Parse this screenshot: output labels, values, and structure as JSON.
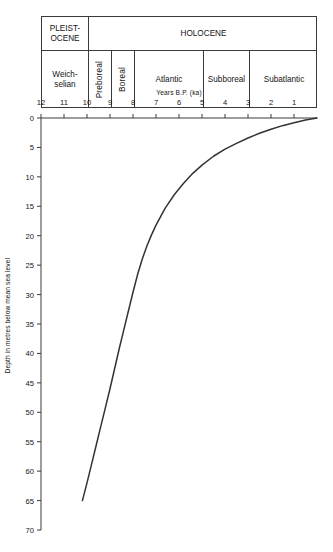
{
  "chart_data": {
    "type": "line",
    "title": "",
    "xlabel": "Years B.P. (ka)",
    "ylabel": "Depth in metres below mean sea level",
    "xlim": [
      12,
      0
    ],
    "ylim": [
      70,
      0
    ],
    "x_inverted": true,
    "y_inverted": true,
    "grid": false,
    "legend": "none",
    "xticks": [
      12,
      11,
      10,
      9,
      8,
      7,
      6,
      5,
      4,
      3,
      2,
      1
    ],
    "xtick_labels": [
      "12",
      "11",
      "10",
      "9",
      "8",
      "7",
      "6",
      "5",
      "4",
      "3",
      "2",
      "1"
    ],
    "yticks": [
      0,
      5,
      10,
      15,
      20,
      25,
      30,
      35,
      40,
      45,
      50,
      55,
      60,
      65,
      70
    ],
    "ytick_labels": [
      "0",
      "5",
      "10",
      "15",
      "20",
      "25",
      "30",
      "35",
      "40",
      "45",
      "50",
      "55",
      "60",
      "65",
      "70"
    ],
    "series": [
      {
        "name": "Relative sea-level curve",
        "color": "#333333",
        "x": [
          10.2,
          10.0,
          9.8,
          9.6,
          9.4,
          9.2,
          9.0,
          8.8,
          8.6,
          8.4,
          8.2,
          8.0,
          7.8,
          7.6,
          7.4,
          7.2,
          7.0,
          6.6,
          6.2,
          5.8,
          5.4,
          5.0,
          4.5,
          4.0,
          3.5,
          3.0,
          2.5,
          2.0,
          1.5,
          1.0,
          0.5,
          0.0
        ],
        "y": [
          65.0,
          62.0,
          58.8,
          55.6,
          52.4,
          49.2,
          46.0,
          42.6,
          39.2,
          36.0,
          32.8,
          29.6,
          26.6,
          24.0,
          21.8,
          19.9,
          18.2,
          15.3,
          13.0,
          11.1,
          9.4,
          8.0,
          6.5,
          5.3,
          4.3,
          3.4,
          2.6,
          1.9,
          1.3,
          0.8,
          0.35,
          0.0
        ]
      }
    ],
    "axis_color": "#3a3a3a"
  },
  "stratigraphy": {
    "epochs": [
      {
        "label": "PLEIST-\nOCENE",
        "label_line1": "PLEIST-",
        "label_line2": "OCENE",
        "start_ka": 12,
        "end_ka": 10
      },
      {
        "label": "HOLOCENE",
        "start_ka": 10,
        "end_ka": 0
      }
    ],
    "stages": [
      {
        "label_line1": "Weich-",
        "label_line2": "selian",
        "label": "Weichselian",
        "start_ka": 12,
        "end_ka": 10,
        "orientation": "horizontal"
      },
      {
        "label": "Preboreal",
        "start_ka": 10,
        "end_ka": 9,
        "orientation": "vertical"
      },
      {
        "label": "Boreal",
        "start_ka": 9,
        "end_ka": 8,
        "orientation": "vertical"
      },
      {
        "label": "Atlantic",
        "start_ka": 8,
        "end_ka": 5,
        "orientation": "horizontal"
      },
      {
        "label": "Subboreal",
        "start_ka": 5,
        "end_ka": 3,
        "orientation": "horizontal"
      },
      {
        "label": "Subatlantic",
        "start_ka": 3,
        "end_ka": 0,
        "orientation": "horizontal"
      }
    ]
  }
}
